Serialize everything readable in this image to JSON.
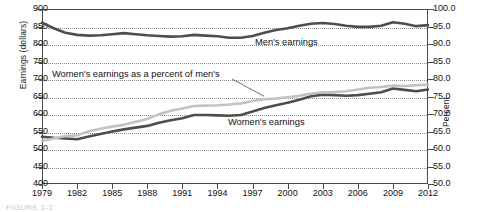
{
  "axes": {
    "ylabel_left": "Earnings (dollars)",
    "ylabel_right": "Percent",
    "left_ticks": [
      "900",
      "850",
      "800",
      "750",
      "700",
      "650",
      "600",
      "550",
      "500",
      "450",
      "400"
    ],
    "right_ticks": [
      "100.0",
      "95.0",
      "90.0",
      "85.0",
      "80.0",
      "75.0",
      "70.0",
      "65.0",
      "60.0",
      "55.0",
      "50.0"
    ],
    "x_ticks": [
      "1979",
      "1982",
      "1985",
      "1988",
      "1991",
      "1994",
      "1997",
      "2000",
      "2003",
      "2006",
      "2009",
      "2012"
    ]
  },
  "labels": {
    "men": "Men's earnings",
    "women": "Women's earnings",
    "percent": "Women's earnings as a percent of men's"
  },
  "caption_partial": "FIGURE 1-1",
  "colors": {
    "men_line": "#4d4d4d",
    "women_line": "#4d4d4d",
    "percent_line": "#c2c2c2",
    "axis": "#4a4a4a",
    "grid": "#8e8e8e"
  },
  "chart_data": {
    "type": "line",
    "title": "",
    "xlabel": "",
    "ylabel": "Earnings (dollars)",
    "ylabel_secondary": "Percent",
    "ylim": [
      400,
      900
    ],
    "ylim_secondary": [
      50.0,
      100.0
    ],
    "grid": true,
    "legend": "inline-annotations",
    "x": [
      1979,
      1980,
      1981,
      1982,
      1983,
      1984,
      1985,
      1986,
      1987,
      1988,
      1989,
      1990,
      1991,
      1992,
      1993,
      1994,
      1995,
      1996,
      1997,
      1998,
      1999,
      2000,
      2001,
      2002,
      2003,
      2004,
      2005,
      2006,
      2007,
      2008,
      2009,
      2010,
      2011,
      2012
    ],
    "series": [
      {
        "name": "Men's earnings",
        "axis": "left",
        "unit": "dollars",
        "values": [
          861,
          845,
          832,
          826,
          824,
          825,
          828,
          831,
          828,
          825,
          823,
          821,
          822,
          826,
          824,
          822,
          818,
          818,
          823,
          832,
          840,
          845,
          852,
          858,
          860,
          857,
          852,
          849,
          849,
          852,
          862,
          858,
          851,
          854
        ]
      },
      {
        "name": "Women's earnings",
        "axis": "left",
        "unit": "dollars",
        "values": [
          535,
          532,
          530,
          528,
          536,
          543,
          550,
          556,
          561,
          566,
          575,
          582,
          588,
          597,
          597,
          596,
          595,
          597,
          607,
          617,
          625,
          632,
          641,
          651,
          655,
          654,
          652,
          654,
          658,
          662,
          673,
          669,
          665,
          670
        ]
      },
      {
        "name": "Women's earnings as a percent of men's",
        "axis": "right",
        "unit": "percent",
        "values": [
          62.3,
          63.0,
          63.7,
          63.9,
          65.1,
          65.8,
          66.4,
          66.9,
          67.8,
          68.6,
          69.9,
          70.9,
          71.6,
          72.3,
          72.4,
          72.5,
          72.7,
          73.0,
          73.7,
          74.2,
          74.4,
          74.8,
          75.2,
          75.8,
          76.2,
          76.3,
          76.5,
          77.0,
          77.5,
          77.7,
          78.1,
          78.0,
          78.2,
          78.4
        ]
      }
    ]
  }
}
